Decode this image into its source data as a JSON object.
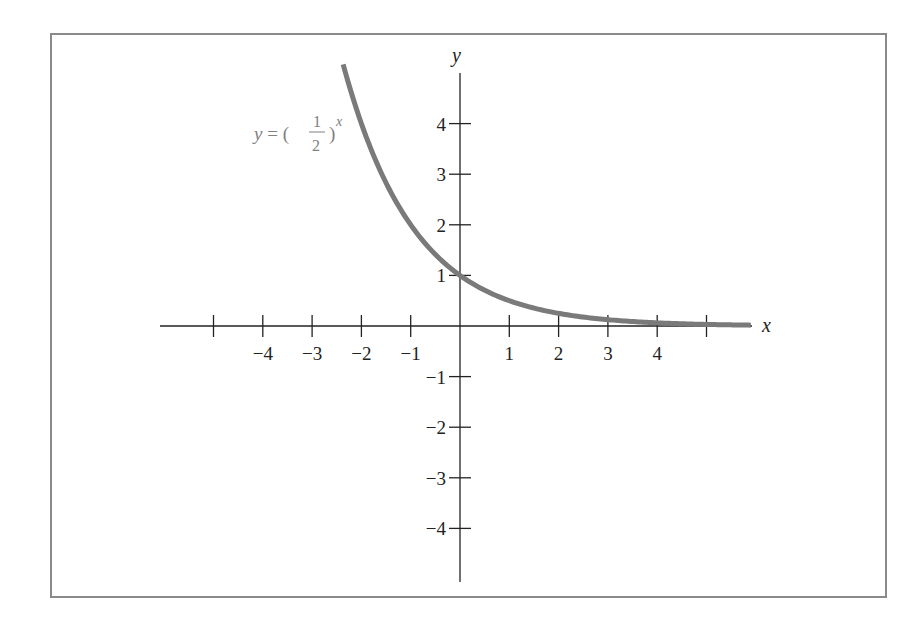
{
  "chart_data": {
    "type": "line",
    "title": "",
    "xlabel": "x",
    "ylabel": "y",
    "xlim": [
      -5.0,
      5.9
    ],
    "ylim": [
      -5.1,
      5.0
    ],
    "grid": false,
    "x_ticks": [
      -5,
      -4,
      -3,
      -2,
      -1,
      1,
      2,
      3,
      4,
      5
    ],
    "x_tick_labels": [
      "",
      "−4",
      "−3",
      "−2",
      "−1",
      "1",
      "2",
      "3",
      "4",
      ""
    ],
    "y_ticks": [
      -4,
      -3,
      -2,
      -1,
      1,
      2,
      3,
      4
    ],
    "y_tick_labels": [
      "−4",
      "−3",
      "−2",
      "−1",
      "1",
      "2",
      "3",
      "4"
    ],
    "series": [
      {
        "name": "y = (1/2)^x",
        "function": "0.5^x",
        "x_range": [
          -2.37,
          5.9
        ],
        "color": "#7a7a7a",
        "x": [
          -2.37,
          -2,
          -1,
          0,
          1,
          2,
          3,
          4,
          5,
          5.9
        ],
        "y": [
          5.17,
          4,
          2,
          1,
          0.5,
          0.25,
          0.125,
          0.0625,
          0.03125,
          0.0167
        ]
      }
    ],
    "annotations": [
      {
        "text_parts": {
          "lhs": "y = (",
          "num": "1",
          "den": "2",
          "rhs": ")",
          "exp": "x"
        },
        "position": "upper-left of curve"
      }
    ]
  },
  "labels": {
    "x_axis": "x",
    "y_axis": "y",
    "eq_lhs": "y = (",
    "eq_num": "1",
    "eq_den": "2",
    "eq_rhs": ")",
    "eq_exp": "x"
  },
  "colors": {
    "curve": "#7a7a7a",
    "axis": "#222222",
    "frame": "#8a8a8a",
    "equation": "#808080"
  }
}
